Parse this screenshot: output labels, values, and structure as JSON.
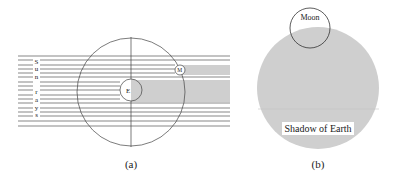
{
  "colors": {
    "shadow": "#cfcfcf",
    "line": "#555555",
    "background": "#ffffff"
  },
  "panel_a": {
    "caption": "(a)",
    "sun_rays_letters": [
      "S",
      "u",
      "n",
      "",
      "r",
      "a",
      "y",
      "s"
    ],
    "earth_label": "E",
    "moon_label": "M"
  },
  "panel_b": {
    "caption": "(b)",
    "moon_label": "Moon",
    "shadow_label": "Shadow of Earth"
  }
}
